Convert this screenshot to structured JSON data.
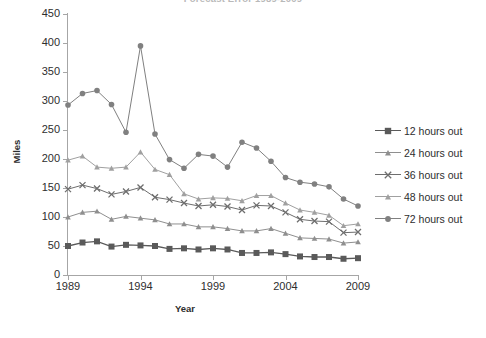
{
  "chart_data": {
    "type": "line",
    "title": "Forecast Error 1989-2009",
    "xlabel": "Year",
    "ylabel": "Miles",
    "x": [
      1989,
      1990,
      1991,
      1992,
      1993,
      1994,
      1995,
      1996,
      1997,
      1998,
      1999,
      2000,
      2001,
      2002,
      2003,
      2004,
      2005,
      2006,
      2007,
      2008,
      2009
    ],
    "xlim": [
      1989,
      2009
    ],
    "ylim": [
      0,
      450
    ],
    "ytick_labels": [
      "0",
      "50",
      "100",
      "150",
      "200",
      "250",
      "300",
      "350",
      "400",
      "450"
    ],
    "yticks": [
      0,
      50,
      100,
      150,
      200,
      250,
      300,
      350,
      400,
      450
    ],
    "xtick_labels": [
      "1989",
      "1994",
      "1999",
      "2004",
      "2009"
    ],
    "xticks": [
      1989,
      1994,
      1999,
      2004,
      2009
    ],
    "grid": false,
    "legend_position": "right",
    "series": [
      {
        "name": "12 hours out",
        "marker": "square",
        "color": "#5a5a5a",
        "values": [
          50,
          56,
          58,
          49,
          52,
          51,
          50,
          45,
          46,
          44,
          46,
          44,
          38,
          38,
          39,
          36,
          32,
          31,
          31,
          28,
          29
        ]
      },
      {
        "name": "24 hours out",
        "marker": "triangle",
        "color": "#8f8f8f",
        "values": [
          100,
          108,
          110,
          96,
          101,
          98,
          95,
          88,
          88,
          83,
          83,
          80,
          76,
          76,
          80,
          72,
          64,
          63,
          62,
          55,
          57
        ]
      },
      {
        "name": "36 hours out",
        "marker": "cross",
        "color": "#6e6e6e",
        "values": [
          148,
          155,
          149,
          139,
          144,
          151,
          134,
          130,
          124,
          119,
          121,
          118,
          112,
          120,
          119,
          108,
          96,
          93,
          92,
          73,
          74
        ]
      },
      {
        "name": "48 hours out",
        "marker": "triangle",
        "color": "#a0a0a0",
        "values": [
          198,
          205,
          186,
          184,
          186,
          212,
          182,
          173,
          140,
          131,
          133,
          132,
          128,
          137,
          137,
          124,
          112,
          108,
          103,
          85,
          88
        ]
      },
      {
        "name": "72 hours out",
        "marker": "circle",
        "color": "#808080",
        "values": [
          293,
          313,
          318,
          294,
          246,
          395,
          243,
          199,
          184,
          208,
          205,
          186,
          229,
          219,
          196,
          168,
          160,
          157,
          152,
          131,
          119
        ]
      }
    ]
  },
  "legend": {
    "items": [
      {
        "label": "12 hours out"
      },
      {
        "label": "24 hours out"
      },
      {
        "label": "36 hours out"
      },
      {
        "label": "48 hours out"
      },
      {
        "label": "72 hours out"
      }
    ]
  }
}
